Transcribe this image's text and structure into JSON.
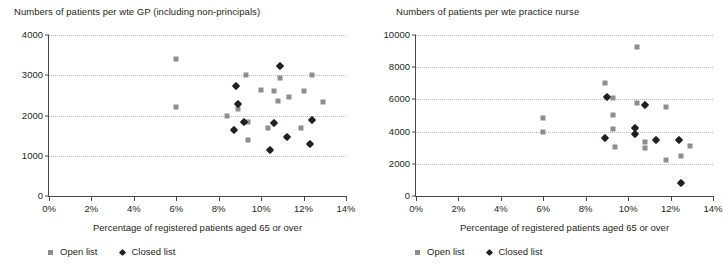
{
  "chart_data": [
    {
      "id": "gp",
      "type": "scatter",
      "title": "Numbers of patients per wte GP (including non-principals)",
      "xlabel": "Percentage of registered patients aged 65 or over",
      "ylabel": "",
      "xlim": [
        0,
        14
      ],
      "ylim": [
        0,
        4000
      ],
      "xticks": [
        "0%",
        "2%",
        "4%",
        "6%",
        "8%",
        "10%",
        "12%",
        "14%"
      ],
      "xtick_values": [
        0,
        2,
        4,
        6,
        8,
        10,
        12,
        14
      ],
      "yticks": [
        "0",
        "1000",
        "2000",
        "3000",
        "4000"
      ],
      "ytick_values": [
        0,
        1000,
        2000,
        3000,
        4000
      ],
      "grid": "horizontal-dotted",
      "legend_position": "below-axis-left",
      "series": [
        {
          "name": "Open list",
          "marker": "square",
          "color": "#8e8e8e",
          "points": [
            [
              6.0,
              3400
            ],
            [
              6.0,
              2200
            ],
            [
              8.4,
              1980
            ],
            [
              8.9,
              2160
            ],
            [
              9.3,
              3010
            ],
            [
              9.4,
              1830
            ],
            [
              9.4,
              1380
            ],
            [
              10.0,
              2630
            ],
            [
              10.3,
              1700
            ],
            [
              10.6,
              2620
            ],
            [
              10.8,
              2360
            ],
            [
              10.9,
              2920
            ],
            [
              11.3,
              2470
            ],
            [
              11.9,
              1680
            ],
            [
              12.0,
              2620
            ],
            [
              12.4,
              3010
            ],
            [
              12.9,
              2340
            ]
          ]
        },
        {
          "name": "Closed list",
          "marker": "diamond",
          "color": "#231f20",
          "points": [
            [
              8.7,
              1650
            ],
            [
              8.8,
              2740
            ],
            [
              8.9,
              2290
            ],
            [
              9.2,
              1840
            ],
            [
              10.4,
              1140
            ],
            [
              10.6,
              1820
            ],
            [
              10.9,
              3220
            ],
            [
              11.2,
              1470
            ],
            [
              12.3,
              1300
            ],
            [
              12.4,
              1900
            ]
          ]
        }
      ],
      "legend": [
        "Open list",
        "Closed list"
      ]
    },
    {
      "id": "nurse",
      "type": "scatter",
      "title": "Numbers of patients per wte practice nurse",
      "xlabel": "Percentage of registered patients aged 65 or over",
      "ylabel": "",
      "xlim": [
        0,
        14
      ],
      "ylim": [
        0,
        10000
      ],
      "xticks": [
        "0%",
        "2%",
        "4%",
        "6%",
        "8%",
        "10%",
        "12%",
        "14%"
      ],
      "xtick_values": [
        0,
        2,
        4,
        6,
        8,
        10,
        12,
        14
      ],
      "yticks": [
        "0",
        "2000",
        "4000",
        "6000",
        "8000",
        "10000"
      ],
      "ytick_values": [
        0,
        2000,
        4000,
        6000,
        8000,
        10000
      ],
      "grid": "horizontal-dotted",
      "legend_position": "below-axis-left",
      "series": [
        {
          "name": "Open list",
          "marker": "square",
          "color": "#8e8e8e",
          "points": [
            [
              6.0,
              4830
            ],
            [
              6.0,
              3980
            ],
            [
              8.9,
              7020
            ],
            [
              9.3,
              6080
            ],
            [
              9.3,
              5060
            ],
            [
              9.3,
              4160
            ],
            [
              9.4,
              3060
            ],
            [
              10.4,
              9250
            ],
            [
              10.4,
              5760
            ],
            [
              10.8,
              3350
            ],
            [
              10.8,
              2980
            ],
            [
              11.8,
              5540
            ],
            [
              11.8,
              2250
            ],
            [
              12.5,
              2500
            ],
            [
              12.9,
              3080
            ]
          ]
        },
        {
          "name": "Closed list",
          "marker": "diamond",
          "color": "#231f20",
          "points": [
            [
              8.9,
              3600
            ],
            [
              9.0,
              6140
            ],
            [
              10.3,
              4250
            ],
            [
              10.3,
              3830
            ],
            [
              10.8,
              5640
            ],
            [
              11.3,
              3450
            ],
            [
              12.4,
              3460
            ],
            [
              12.5,
              820
            ]
          ]
        }
      ],
      "legend": [
        "Open list",
        "Closed list"
      ]
    }
  ]
}
